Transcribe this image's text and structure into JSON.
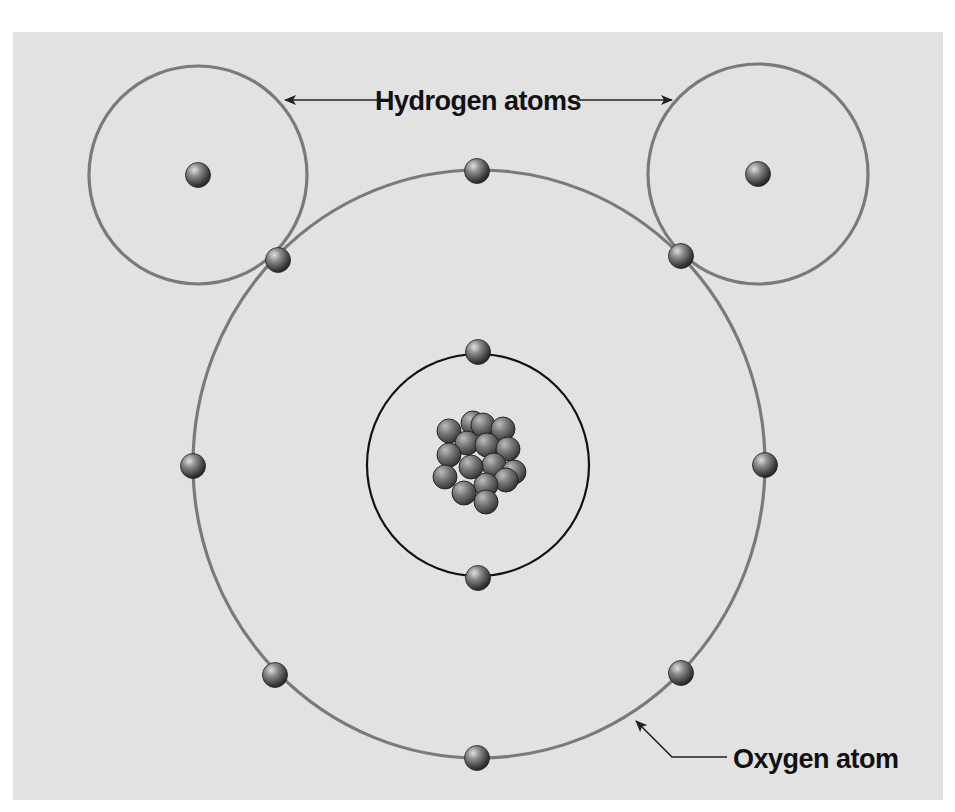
{
  "diagram": {
    "labels": {
      "hydrogen": "Hydrogen atoms",
      "oxygen": "Oxygen atom"
    },
    "colors": {
      "background": "#e2e2e2",
      "outer_orbit": "#7a7a7a",
      "inner_orbit": "#111111",
      "text": "#111111",
      "sphere_highlight": "#d8d8d8",
      "sphere_shadow": "#2a2a2a"
    },
    "hydrogen_atoms": [
      {
        "name": "hydrogen-left",
        "orbit": {
          "cx": 198,
          "cy": 175,
          "r": 109
        },
        "nucleus": {
          "cx": 198,
          "cy": 175
        }
      },
      {
        "name": "hydrogen-right",
        "orbit": {
          "cx": 758,
          "cy": 174,
          "r": 110
        },
        "nucleus": {
          "cx": 758,
          "cy": 174
        }
      }
    ],
    "oxygen_atom": {
      "outer_orbit": {
        "cx": 479,
        "cy": 464,
        "rx": 286,
        "ry": 294
      },
      "inner_orbit": {
        "cx": 478,
        "cy": 465,
        "r": 111
      },
      "outer_electrons": [
        {
          "cx": 477,
          "cy": 171
        },
        {
          "cx": 278,
          "cy": 260
        },
        {
          "cx": 681,
          "cy": 256
        },
        {
          "cx": 193,
          "cy": 466
        },
        {
          "cx": 765,
          "cy": 465
        },
        {
          "cx": 275,
          "cy": 675
        },
        {
          "cx": 681,
          "cy": 673
        },
        {
          "cx": 477,
          "cy": 758
        }
      ],
      "inner_electrons": [
        {
          "cx": 478,
          "cy": 352
        },
        {
          "cx": 478,
          "cy": 578
        }
      ],
      "nucleus_particles": [
        {
          "cx": 473,
          "cy": 423
        },
        {
          "cx": 483,
          "cy": 425
        },
        {
          "cx": 449,
          "cy": 431
        },
        {
          "cx": 503,
          "cy": 429
        },
        {
          "cx": 467,
          "cy": 443
        },
        {
          "cx": 487,
          "cy": 445
        },
        {
          "cx": 508,
          "cy": 449
        },
        {
          "cx": 449,
          "cy": 455
        },
        {
          "cx": 494,
          "cy": 465
        },
        {
          "cx": 514,
          "cy": 472
        },
        {
          "cx": 445,
          "cy": 477
        },
        {
          "cx": 506,
          "cy": 480
        },
        {
          "cx": 486,
          "cy": 485
        },
        {
          "cx": 471,
          "cy": 467
        },
        {
          "cx": 464,
          "cy": 493
        },
        {
          "cx": 486,
          "cy": 502
        }
      ],
      "electron_count_outer": 6,
      "electron_count_inner": 2,
      "nucleus_particle_count": 16
    },
    "callouts": {
      "hydrogen": {
        "text_x": 478,
        "text_y": 110,
        "left_arrow": {
          "x1": 378,
          "y1": 100,
          "x2": 285,
          "y2": 100
        },
        "right_arrow": {
          "x1": 577,
          "y1": 100,
          "x2": 672,
          "y2": 100
        }
      },
      "oxygen": {
        "text_x": 733,
        "text_y": 768,
        "leader": [
          [
            727,
            757
          ],
          [
            672,
            757
          ],
          [
            636,
            721
          ]
        ]
      }
    }
  }
}
